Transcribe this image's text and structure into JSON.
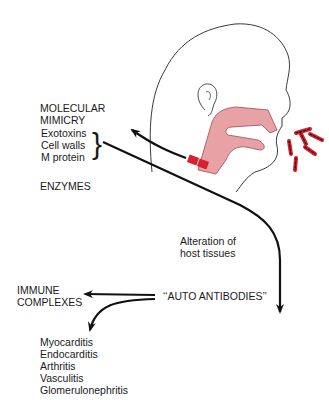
{
  "diagram": {
    "molecular_mimicry": {
      "title_line1": "MOLECULAR",
      "title_line2": "MIMICRY",
      "items": [
        "Exotoxins",
        "Cell walls",
        "M protein"
      ]
    },
    "enzymes": "ENZYMES",
    "alteration": {
      "line1": "Alteration of",
      "line2": "host tissues"
    },
    "auto_antibodies": "‘‘AUTO ANTIBODIES’’",
    "immune_complexes": {
      "line1": "IMMUNE",
      "line2": "COMPLEXES"
    },
    "diseases": [
      "Myocarditis",
      "Endocarditis",
      "Arthritis",
      "Vasculitis",
      "Glomerulonephritis"
    ],
    "colors": {
      "airway_fill": "#e8a2a6",
      "airway_stroke": "#9a4a4e",
      "bacteria_red": "#d8202e",
      "bacteria_dark": "#2a0a0a",
      "line": "#111111"
    }
  }
}
